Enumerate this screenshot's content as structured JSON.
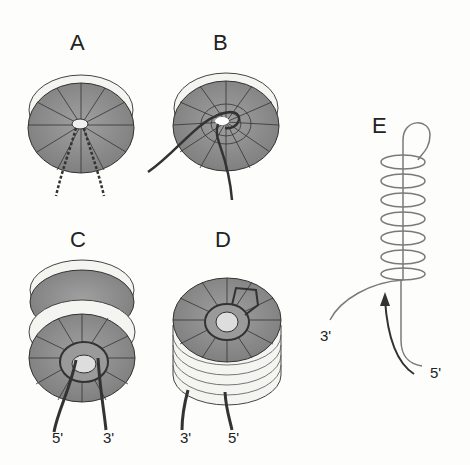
{
  "figure": {
    "panels": [
      {
        "id": "A",
        "label": "A",
        "ends": []
      },
      {
        "id": "B",
        "label": "B",
        "ends": []
      },
      {
        "id": "C",
        "label": "C",
        "ends": [
          "5'",
          "3'"
        ]
      },
      {
        "id": "D",
        "label": "D",
        "ends": [
          "3'",
          "5'"
        ]
      },
      {
        "id": "E",
        "label": "E",
        "ends": [
          "3'",
          "5'"
        ]
      }
    ],
    "colors": {
      "disk_face": "#8a8a8a",
      "disk_rim": "#f4f4f0",
      "strand": "#3a3a3a",
      "helix": "#7a7a7a",
      "background": "#fdfdfb"
    }
  }
}
